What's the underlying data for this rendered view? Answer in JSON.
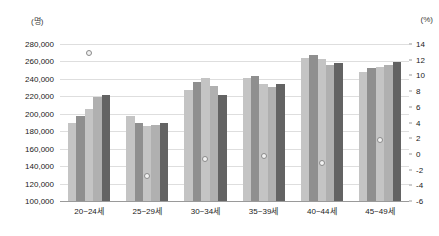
{
  "chart_data": {
    "type": "bar",
    "title": "",
    "xlabel": "",
    "ylabel": "(명)",
    "y2label": "(%)",
    "grid": true,
    "legend": "none",
    "categories": [
      "20~24세",
      "25~29세",
      "30~34세",
      "35~39세",
      "40~44세",
      "45~49세"
    ],
    "ylim": [
      100000,
      280000
    ],
    "yticks": [
      "100,000",
      "120,000",
      "140,000",
      "160,000",
      "180,000",
      "200,000",
      "220,000",
      "240,000",
      "260,000",
      "280,000"
    ],
    "ytick_values": [
      100000,
      120000,
      140000,
      160000,
      180000,
      200000,
      220000,
      240000,
      260000,
      280000
    ],
    "y2lim": [
      -6,
      14
    ],
    "y2ticks": [
      "-6",
      "-4",
      "-2",
      "0",
      "2",
      "4",
      "6",
      "8",
      "10",
      "12",
      "14"
    ],
    "y2tick_values": [
      -6,
      -4,
      -2,
      0,
      2,
      4,
      6,
      8,
      10,
      12,
      14
    ],
    "series": [
      {
        "name": "bar-1",
        "color": "#c4c4c4",
        "values": [
          189000,
          198000,
          227000,
          241000,
          264000,
          248000
        ]
      },
      {
        "name": "bar-2",
        "color": "#8f8f8f",
        "values": [
          198000,
          190000,
          236000,
          243000,
          267000,
          252000
        ]
      },
      {
        "name": "bar-3",
        "color": "#c4c4c4",
        "values": [
          205000,
          186000,
          241000,
          234000,
          263000,
          254000
        ]
      },
      {
        "name": "bar-4",
        "color": "#b0b0b0",
        "values": [
          219000,
          187000,
          232000,
          231000,
          256000,
          256000
        ]
      },
      {
        "name": "bar-5",
        "color": "#636363",
        "values": [
          222000,
          190000,
          221000,
          234000,
          258000,
          259000
        ]
      }
    ],
    "marker_series": {
      "name": "rate-marker",
      "axis": "right",
      "color": "#8a8a8a",
      "values": [
        12.9,
        -2.8,
        -0.7,
        -0.3,
        -1.2,
        1.8
      ]
    }
  }
}
